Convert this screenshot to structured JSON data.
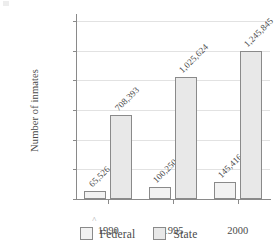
{
  "chart_data": {
    "type": "bar",
    "title": "",
    "xlabel": "",
    "ylabel": "Number of inmates",
    "categories": [
      "1990",
      "1995",
      "2000"
    ],
    "series": [
      {
        "name": "Federal",
        "values": [
          65526,
          100250,
          145416
        ],
        "value_labels": [
          "65,526",
          "100,250",
          "145,416"
        ],
        "color": "#f2f2f2"
      },
      {
        "name": "State",
        "values": [
          708393,
          1025624,
          1245845
        ],
        "value_labels": [
          "708,393",
          "1,025,624",
          "1,245,845"
        ],
        "color": "#e8e8e8"
      }
    ],
    "ylim": [
      0,
      1500000
    ],
    "ytick_values": [
      0,
      250000,
      500000,
      750000,
      1000000,
      1250000,
      1500000
    ],
    "ytick_labels": [
      "0",
      "250,000",
      "500,000",
      "750,000",
      "1,000,000",
      "1,250,000",
      "1,500,000"
    ],
    "grid": true,
    "legend_position": "bottom",
    "legend_entries": [
      "Federal",
      "State"
    ]
  },
  "axis": {
    "y_title": "Number of inmates"
  },
  "legend": {
    "items": [
      {
        "label": "Federal",
        "swatch": "federal-swatch"
      },
      {
        "label": "State",
        "swatch": "state-swatch"
      }
    ]
  }
}
